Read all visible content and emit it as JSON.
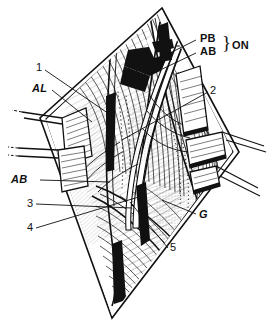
{
  "figure": {
    "style": "black-and-white pen-and-ink anatomical line drawing",
    "background_color": "#ffffff",
    "ink_color": "#111111",
    "width": 276,
    "height": 323
  },
  "labels": {
    "callout_1": "1",
    "callout_2": "2",
    "callout_3": "3",
    "callout_4": "4",
    "callout_5": "5",
    "abbr_al": "AL",
    "abbr_ab_left": "AB",
    "abbr_g": "G",
    "abbr_pb": "PB",
    "abbr_ab_top": "AB",
    "abbr_on": "ON",
    "brace_glyph": "}"
  },
  "structures": {
    "wound": "elongated lens-shaped surgical incision opened by retractors",
    "retractors_left": 2,
    "retractors_right": 3,
    "contents": "muscle bellies with longitudinal fibre hatching, nerve branches and vessels crossing the field"
  }
}
